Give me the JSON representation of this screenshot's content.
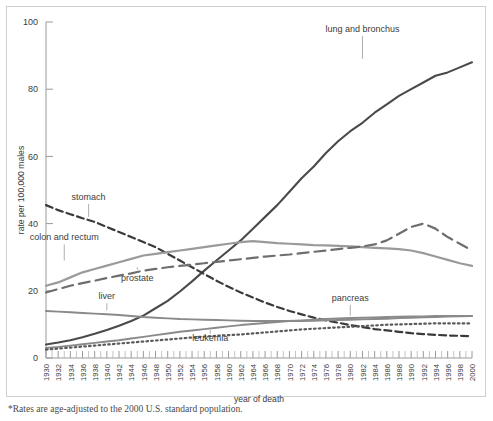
{
  "figure": {
    "footnote": "*Rates are age-adjusted to the 2000 U.S. standard population.",
    "frame_color": "#cfcfcf",
    "background": "#ffffff"
  },
  "axes": {
    "x_title": "year of death",
    "y_title": "rate per 100,000 males",
    "y_ticks": [
      "0",
      "20",
      "40",
      "60",
      "80",
      "100"
    ],
    "x_ticks": [
      "1930",
      "1932",
      "1934",
      "1936",
      "1938",
      "1940",
      "1942",
      "1944",
      "1946",
      "1948",
      "1950",
      "1952",
      "1954",
      "1956",
      "1958",
      "1960",
      "1962",
      "1964",
      "1966",
      "1968",
      "1970",
      "1972",
      "1974",
      "1976",
      "1978",
      "1980",
      "1982",
      "1984",
      "1986",
      "1988",
      "1990",
      "1992",
      "1994",
      "1996",
      "1998",
      "2000"
    ]
  },
  "chart_data": {
    "type": "line",
    "title": "",
    "xlabel": "year of death",
    "ylabel": "rate per 100,000 males",
    "xlim": [
      1930,
      2000
    ],
    "ylim": [
      0,
      100
    ],
    "grid": false,
    "legend": "inline-annotations",
    "x": [
      1930,
      1932,
      1934,
      1936,
      1938,
      1940,
      1942,
      1944,
      1946,
      1948,
      1950,
      1952,
      1954,
      1956,
      1958,
      1960,
      1962,
      1964,
      1966,
      1968,
      1970,
      1972,
      1974,
      1976,
      1978,
      1980,
      1982,
      1984,
      1986,
      1988,
      1990,
      1992,
      1994,
      1996,
      1998,
      2000
    ],
    "series": [
      {
        "name": "lung and bronchus",
        "color": "#4a4a4a",
        "width": 2.1,
        "dash": "none",
        "label_x": 1982,
        "label_y": 97,
        "leader_to_y": 89,
        "values": [
          4.0,
          4.6,
          5.3,
          6.2,
          7.2,
          8.3,
          9.6,
          11.0,
          12.6,
          14.8,
          17.0,
          19.8,
          22.8,
          26.0,
          29.0,
          32.0,
          35.0,
          38.5,
          42.0,
          45.5,
          49.5,
          53.5,
          57.0,
          61.0,
          64.5,
          67.5,
          70.0,
          73.0,
          75.5,
          78.0,
          80.0,
          82.0,
          84.0,
          85.0,
          86.5,
          88.0
        ]
      },
      {
        "name": "stomach",
        "color": "#3a3a3a",
        "width": 2.2,
        "dash": "7,4",
        "label_x": 1937,
        "label_y": 47,
        "leader_to_y": 42,
        "values": [
          45.5,
          44.0,
          42.8,
          41.6,
          40.5,
          39.0,
          37.5,
          36.0,
          34.5,
          33.0,
          31.0,
          29.0,
          27.0,
          25.0,
          23.0,
          21.2,
          19.5,
          18.0,
          16.5,
          15.2,
          14.0,
          13.0,
          12.0,
          11.2,
          10.5,
          9.8,
          9.2,
          8.6,
          8.2,
          7.8,
          7.4,
          7.1,
          6.9,
          6.7,
          6.6,
          6.5
        ]
      },
      {
        "name": "colon and rectum",
        "color": "#9a9a9a",
        "width": 2.2,
        "dash": "none",
        "label_x": 1933,
        "label_y": 35,
        "leader_to_y": 29,
        "values": [
          21.5,
          22.5,
          24.0,
          25.5,
          26.5,
          27.5,
          28.5,
          29.5,
          30.5,
          31.0,
          31.5,
          32.0,
          32.5,
          33.0,
          33.5,
          34.0,
          34.5,
          34.8,
          34.5,
          34.2,
          34.0,
          33.8,
          33.6,
          33.5,
          33.4,
          33.2,
          33.0,
          32.8,
          32.6,
          32.4,
          32.0,
          31.2,
          30.2,
          29.2,
          28.2,
          27.4
        ]
      },
      {
        "name": "prostate",
        "color": "#6e6e6e",
        "width": 2.2,
        "dash": "11,6",
        "label_x": 1945,
        "label_y": 23,
        "leader_to_y": 27,
        "values": [
          19.5,
          20.5,
          21.5,
          22.3,
          23.0,
          23.8,
          24.5,
          25.2,
          26.0,
          26.5,
          27.0,
          27.4,
          27.8,
          28.2,
          28.6,
          29.0,
          29.4,
          29.8,
          30.2,
          30.5,
          30.8,
          31.2,
          31.6,
          32.0,
          32.4,
          32.8,
          33.2,
          33.8,
          35.0,
          37.0,
          39.0,
          40.0,
          38.5,
          36.0,
          34.0,
          32.0
        ]
      },
      {
        "name": "liver",
        "color": "#8a8a8a",
        "width": 1.9,
        "dash": "none",
        "label_x": 1940,
        "label_y": 17.5,
        "leader_to_y": 14.2,
        "values": [
          14.0,
          13.8,
          13.6,
          13.4,
          13.2,
          13.0,
          12.8,
          12.5,
          12.2,
          12.0,
          11.8,
          11.6,
          11.5,
          11.4,
          11.3,
          11.2,
          11.1,
          11.0,
          11.0,
          11.0,
          11.0,
          11.0,
          11.1,
          11.2,
          11.3,
          11.4,
          11.5,
          11.6,
          11.7,
          11.9,
          12.0,
          12.1,
          12.2,
          12.3,
          12.4,
          12.5
        ]
      },
      {
        "name": "pancreas",
        "color": "#8a8a8a",
        "width": 1.9,
        "dash": "none",
        "label_x": 1980,
        "label_y": 17,
        "leader_to_y": 12.6,
        "values": [
          3.0,
          3.3,
          3.7,
          4.1,
          4.5,
          4.9,
          5.3,
          5.8,
          6.3,
          6.8,
          7.3,
          7.8,
          8.2,
          8.6,
          9.0,
          9.4,
          9.8,
          10.1,
          10.4,
          10.7,
          11.0,
          11.2,
          11.4,
          11.6,
          11.8,
          11.9,
          12.0,
          12.1,
          12.2,
          12.3,
          12.4,
          12.4,
          12.5,
          12.5,
          12.5,
          12.5
        ]
      },
      {
        "name": "leukemia",
        "color": "#5a5a5a",
        "width": 2.2,
        "dash": "1.6,3.2",
        "label_x": 1957,
        "label_y": 5.0,
        "leader_to_y": 7.2,
        "values": [
          2.5,
          2.8,
          3.1,
          3.4,
          3.7,
          4.0,
          4.3,
          4.6,
          4.9,
          5.2,
          5.5,
          5.8,
          6.1,
          6.4,
          6.6,
          6.8,
          7.0,
          7.3,
          7.6,
          7.9,
          8.2,
          8.5,
          8.7,
          8.9,
          9.1,
          9.3,
          9.5,
          9.7,
          9.9,
          10.0,
          10.1,
          10.2,
          10.3,
          10.3,
          10.3,
          10.3
        ]
      }
    ]
  }
}
